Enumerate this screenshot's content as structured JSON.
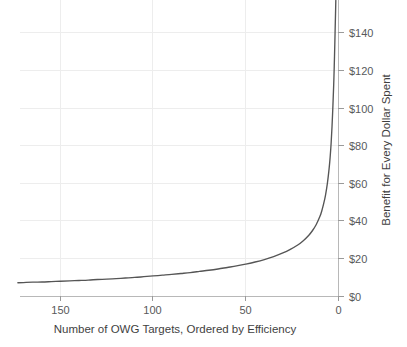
{
  "chart_data": {
    "type": "line",
    "title": "",
    "subtitle": "",
    "xlabel": "Number of OWG Targets, Ordered by Efficiency",
    "ylabel": "Benefit for Every Dollar Spent",
    "xlim": [
      173,
      -2
    ],
    "ylim": [
      0,
      150
    ],
    "x_reversed": true,
    "grid": true,
    "legend": null,
    "legend_position": "none",
    "x_ticks": [
      150,
      100,
      50,
      0
    ],
    "x_tick_labels": [
      "150",
      "100",
      "50",
      "0"
    ],
    "y_ticks": [
      0,
      20,
      40,
      60,
      80,
      100,
      120,
      140
    ],
    "y_tick_labels": [
      "$0",
      "$20",
      "$40",
      "$60",
      "$80",
      "$100",
      "$120",
      "$140"
    ],
    "series": [
      {
        "name": "Benefit per dollar",
        "x": [
          173,
          170,
          165,
          160,
          155,
          150,
          145,
          140,
          135,
          130,
          125,
          120,
          115,
          110,
          105,
          100,
          95,
          90,
          85,
          80,
          75,
          70,
          65,
          60,
          55,
          50,
          45,
          40,
          35,
          30,
          26,
          22,
          19,
          16,
          14,
          12,
          10,
          9,
          8,
          7,
          6,
          5,
          4.5,
          4,
          3.5,
          3,
          2.6,
          2.3,
          2.0,
          1.8,
          1.6,
          1.45
        ],
        "y": [
          7.3,
          7.4,
          7.6,
          7.7,
          7.9,
          8.1,
          8.3,
          8.5,
          8.7,
          9.0,
          9.2,
          9.5,
          9.8,
          10.1,
          10.5,
          10.9,
          11.3,
          11.7,
          12.2,
          12.7,
          13.3,
          13.9,
          14.6,
          15.4,
          16.2,
          17.2,
          18.3,
          19.6,
          21.2,
          23.1,
          25.0,
          27.3,
          29.6,
          32.5,
          35.0,
          38.2,
          42.5,
          45.5,
          49.2,
          53.8,
          60.0,
          68.5,
          74.0,
          81.0,
          90.0,
          101.5,
          112.0,
          122.0,
          133.5,
          142.0,
          150.0,
          157.0
        ]
      }
    ],
    "curve_note": "Monotonic hyperbolic decay: benefit per dollar rises sharply as the number of targets approaches zero"
  },
  "axis": {
    "x_title": "Number of OWG Targets, Ordered by Efficiency",
    "y_title": "Benefit for Every Dollar Spent"
  },
  "colors": {
    "curve": "#555555",
    "gridline": "#ededed",
    "axisline": "#b8b8b8",
    "text": "#4a4a4a",
    "background": "#ffffff"
  }
}
